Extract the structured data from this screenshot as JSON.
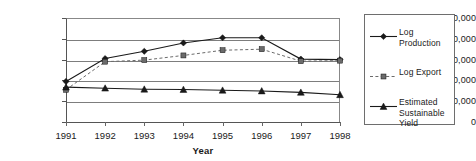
{
  "chart_data": {
    "type": "line",
    "title": "",
    "xlabel": "Year",
    "ylabel": "",
    "categories": [
      "1991",
      "1992",
      "1993",
      "1994",
      "1995",
      "1996",
      "1997",
      "1998"
    ],
    "x": [
      1991,
      1992,
      1993,
      1994,
      1995,
      1996,
      1997,
      1998
    ],
    "xlim": [
      1991,
      1998
    ],
    "ylim": [
      0,
      1000000
    ],
    "ytick_values": [
      0,
      200000,
      400000,
      600000,
      800000,
      1000000
    ],
    "ytick_labels": [
      "0",
      "200,000",
      "400,000",
      "600,000",
      "800,000",
      "1,000,000"
    ],
    "grid": "horizontal",
    "legend_position": "right",
    "series": [
      {
        "name": "Log Production",
        "marker": "diamond",
        "linestyle": "solid",
        "color": "#1a1a1a",
        "values": [
          390000,
          610000,
          680000,
          760000,
          810000,
          810000,
          605000,
          600000
        ]
      },
      {
        "name": "Log Export",
        "marker": "square",
        "linestyle": "dashed",
        "color": "#6b6b6b",
        "values": [
          310000,
          580000,
          595000,
          640000,
          690000,
          700000,
          585000,
          590000
        ]
      },
      {
        "name": "Estimated Sustainable Yield",
        "marker": "triangle",
        "linestyle": "solid",
        "color": "#1a1a1a",
        "values": [
          335000,
          325000,
          315000,
          312000,
          305000,
          298000,
          285000,
          262000
        ]
      }
    ]
  }
}
